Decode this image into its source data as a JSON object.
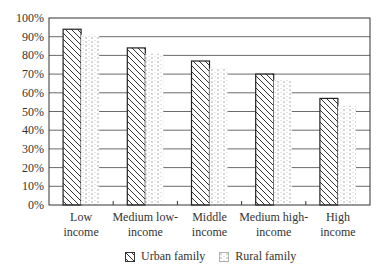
{
  "chart_data": {
    "type": "bar",
    "title": "",
    "xlabel": "",
    "ylabel": "",
    "ylim": [
      0,
      100
    ],
    "y_ticks": [
      "0%",
      "10%",
      "20%",
      "30%",
      "40%",
      "50%",
      "60%",
      "70%",
      "80%",
      "90%",
      "100%"
    ],
    "grid": true,
    "legend_position": "bottom",
    "categories": [
      [
        "Low",
        "income"
      ],
      [
        "Medium low-",
        "income"
      ],
      [
        "Middle",
        "income"
      ],
      [
        "Medium high-",
        "income"
      ],
      [
        "High",
        "income"
      ]
    ],
    "series": [
      {
        "name": "Urban family",
        "pattern": "diagonal-hatch",
        "values": [
          94,
          84,
          77,
          70,
          57
        ]
      },
      {
        "name": "Rural family",
        "pattern": "dotted-dash",
        "values": [
          91,
          81,
          73,
          67,
          53
        ]
      }
    ]
  },
  "legend": {
    "items": [
      {
        "label": "Urban family"
      },
      {
        "label": "Rural family"
      }
    ]
  }
}
